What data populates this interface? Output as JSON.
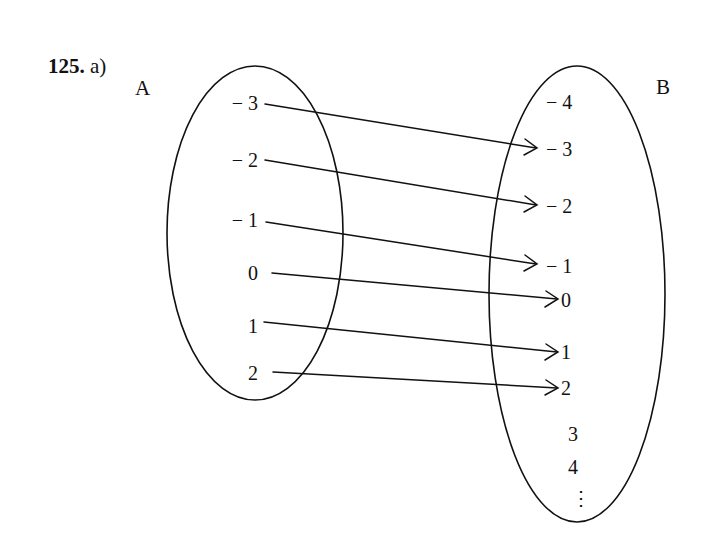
{
  "title": {
    "number": "125.",
    "part": "a)"
  },
  "sets": {
    "A": {
      "name": "A",
      "elements": [
        "− 3",
        "− 2",
        "− 1",
        "0",
        "1",
        "2"
      ]
    },
    "B": {
      "name": "B",
      "elements": [
        "− 4",
        "− 3",
        "− 2",
        "− 1",
        "0",
        "1",
        "2",
        "3",
        "4",
        "⋮"
      ]
    }
  },
  "mapping": [
    {
      "from": "-3",
      "to": "-3"
    },
    {
      "from": "-2",
      "to": "-2"
    },
    {
      "from": "-1",
      "to": "-1"
    },
    {
      "from": "0",
      "to": "0"
    },
    {
      "from": "1",
      "to": "1"
    },
    {
      "from": "2",
      "to": "2"
    }
  ],
  "colors": {
    "stroke": "#111111",
    "background": "#ffffff"
  }
}
